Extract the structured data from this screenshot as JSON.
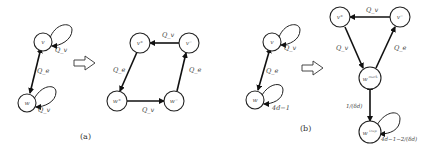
{
  "panel_a": {
    "caption": "(a)",
    "before": {
      "nodes": [
        {
          "id": "v",
          "label": "v"
        },
        {
          "id": "w",
          "label": "w"
        }
      ],
      "edge_label": "Q_e",
      "loop_v_label": "Q_v",
      "loop_w_label": "Q_v"
    },
    "after": {
      "nodes": [
        {
          "id": "v_plus",
          "label": "v⁺"
        },
        {
          "id": "v_minus",
          "label": "v⁻"
        },
        {
          "id": "w_plus",
          "label": "w⁺"
        },
        {
          "id": "w_minus",
          "label": "w⁻"
        }
      ],
      "edge_top_label": "Q_v",
      "edge_left_label": "Q_e",
      "edge_bottom_label": "Q_v",
      "edge_right_label": "Q_e"
    }
  },
  "panel_b": {
    "caption": "(b)",
    "before": {
      "nodes": [
        {
          "id": "v",
          "label": "v"
        },
        {
          "id": "w",
          "label": "w"
        }
      ],
      "edge_label": "Q_e",
      "loop_v_label": "Q_v",
      "loop_w_label": "4d−1"
    },
    "after": {
      "nodes": [
        {
          "id": "v_plus",
          "label": "v⁺"
        },
        {
          "id": "v_minus",
          "label": "v⁻"
        },
        {
          "id": "w_mark",
          "label": "w",
          "sup": "mark"
        },
        {
          "id": "w_trap",
          "label": "w",
          "sup": "trap"
        }
      ],
      "edge_top_label": "Q_v",
      "edge_left_label": "Q_v",
      "edge_right_label": "Q_e",
      "edge_mark_trap_label": "1/(δd)",
      "loop_trap_label": "4d−1−2/(δd)"
    }
  },
  "transform_arrow": "hollow-right-arrow"
}
